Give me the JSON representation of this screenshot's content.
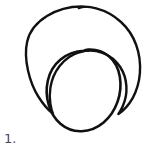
{
  "page": {
    "background_color": "#ffffff",
    "width": 165,
    "height": 155
  },
  "caption": {
    "text": "1.",
    "color": "#4a4a4a"
  },
  "drawing": {
    "style": "hand-drawn ink sketch",
    "stroke_color": "#111111",
    "fill": "none",
    "description": "Two nested hand-drawn closed curves: a large outer circle and a smaller inner circle tangent to it near the bottom",
    "shapes": [
      {
        "name": "outer-circle",
        "type": "circle",
        "center_x": 83,
        "center_y": 67,
        "radius_x": 56,
        "radius_y": 61,
        "stroke_width": 2.4,
        "closed": true
      },
      {
        "name": "inner-circle",
        "type": "circle",
        "center_x": 84,
        "center_y": 89,
        "radius_x": 37,
        "radius_y": 39,
        "stroke_width": 2.6,
        "closed": true
      }
    ]
  }
}
